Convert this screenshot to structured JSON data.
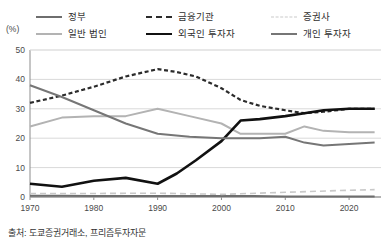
{
  "unit_label": "(%)",
  "source_note": "출처: 도쿄증권거래소, 프리즘투자자문",
  "colors": {
    "government": "#6e6e6e",
    "financial_institutions": "#2b2b2b",
    "securities_firms": "#c9c9c9",
    "general_corporations": "#b3b3b3",
    "foreign_investors": "#111111",
    "individual_investors": "#767676",
    "gridline": "#d9d9d9",
    "axis": "#8c8c8c",
    "text": "#333333"
  },
  "legend": {
    "rows": [
      [
        {
          "label": "정부",
          "style": "solid",
          "color": "#6e6e6e",
          "width": 2.2,
          "name": "government"
        },
        {
          "label": "금융기관",
          "style": "dashed",
          "color": "#2b2b2b",
          "width": 2.4,
          "name": "financial-institutions"
        },
        {
          "label": "증권사",
          "style": "dashed-long",
          "color": "#c9c9c9",
          "width": 1.8,
          "name": "securities-firms"
        }
      ],
      [
        {
          "label": "일반 법인",
          "style": "solid",
          "color": "#b3b3b3",
          "width": 2.2,
          "name": "general-corporations"
        },
        {
          "label": "외국인 투자자",
          "style": "solid",
          "color": "#111111",
          "width": 2.8,
          "name": "foreign-investors"
        },
        {
          "label": "개인 투자자",
          "style": "solid",
          "color": "#767676",
          "width": 2.2,
          "name": "individual-investors"
        }
      ]
    ]
  },
  "chart_data": {
    "type": "line",
    "title": "",
    "subtitle": "",
    "xlabel": "",
    "ylabel": "(%)",
    "xlim": [
      1970,
      2025
    ],
    "ylim": [
      0,
      50
    ],
    "yticks": [
      0,
      10,
      20,
      30,
      40,
      50
    ],
    "xticks": [
      1970,
      1980,
      1990,
      2000,
      2010,
      2020
    ],
    "grid": true,
    "legend_position": "top",
    "series": [
      {
        "name": "정부",
        "color": "#6e6e6e",
        "style": "solid",
        "width": 2.0,
        "x": [
          1970,
          1975,
          1980,
          1985,
          1990,
          1995,
          2000,
          2005,
          2010,
          2015,
          2020,
          2024
        ],
        "values": [
          0.4,
          0.4,
          0.3,
          0.3,
          0.3,
          0.3,
          0.3,
          0.3,
          0.2,
          0.2,
          0.2,
          0.2
        ]
      },
      {
        "name": "금융기관",
        "color": "#2b2b2b",
        "style": "dashed",
        "width": 2.2,
        "x": [
          1970,
          1975,
          1980,
          1985,
          1990,
          1993,
          1996,
          2000,
          2003,
          2006,
          2010,
          2013,
          2016,
          2020,
          2024
        ],
        "values": [
          32.0,
          34.5,
          37.5,
          41.0,
          43.5,
          42.5,
          41.0,
          37.0,
          33.0,
          31.0,
          29.5,
          28.5,
          29.0,
          30.0,
          30.0
        ]
      },
      {
        "name": "증권사",
        "color": "#c9c9c9",
        "style": "dashed-long",
        "width": 1.6,
        "x": [
          1970,
          1980,
          1990,
          2000,
          2010,
          2020,
          2024
        ],
        "values": [
          1.2,
          1.2,
          1.3,
          0.9,
          1.6,
          2.3,
          2.5
        ]
      },
      {
        "name": "일반 법인",
        "color": "#b3b3b3",
        "style": "solid",
        "width": 2.0,
        "x": [
          1970,
          1975,
          1980,
          1985,
          1990,
          1995,
          2000,
          2003,
          2006,
          2010,
          2013,
          2016,
          2020,
          2024
        ],
        "values": [
          24.0,
          27.0,
          27.5,
          27.5,
          30.0,
          27.5,
          25.0,
          21.5,
          21.5,
          21.5,
          24.0,
          22.5,
          22.0,
          22.0
        ]
      },
      {
        "name": "외국인 투자자",
        "color": "#111111",
        "style": "solid",
        "width": 2.6,
        "x": [
          1970,
          1975,
          1980,
          1985,
          1990,
          1993,
          1996,
          2000,
          2003,
          2006,
          2010,
          2013,
          2016,
          2020,
          2024
        ],
        "values": [
          4.5,
          3.5,
          5.5,
          6.5,
          4.5,
          8.0,
          12.5,
          19.0,
          26.0,
          26.5,
          27.5,
          28.5,
          29.5,
          30.0,
          30.0
        ]
      },
      {
        "name": "개인 투자자",
        "color": "#767676",
        "style": "solid",
        "width": 2.0,
        "x": [
          1970,
          1975,
          1980,
          1985,
          1990,
          1995,
          2000,
          2003,
          2006,
          2010,
          2013,
          2016,
          2020,
          2024
        ],
        "values": [
          38.0,
          34.0,
          29.5,
          25.0,
          21.5,
          20.5,
          20.0,
          20.0,
          20.0,
          20.5,
          18.5,
          17.5,
          18.0,
          18.5
        ]
      }
    ]
  }
}
